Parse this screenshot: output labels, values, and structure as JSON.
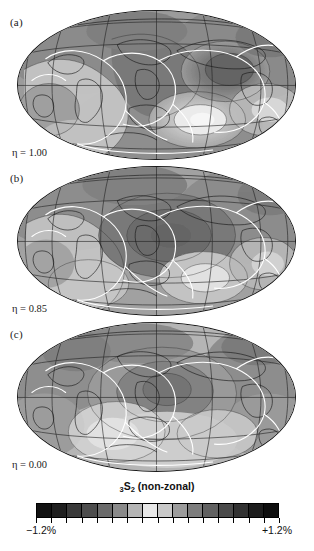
{
  "figure": {
    "type": "map-series",
    "projection": "hammer",
    "panels": [
      {
        "id": "a",
        "label": "(a)",
        "eta_symbol": "η",
        "eta_text": "η = 1.00",
        "eta_value": "1.00"
      },
      {
        "id": "b",
        "label": "(b)",
        "eta_symbol": "η",
        "eta_text": "η = 0.85",
        "eta_value": "0.85"
      },
      {
        "id": "c",
        "label": "(c)",
        "eta_symbol": "η",
        "eta_text": "η = 0.00",
        "eta_value": "0.00"
      }
    ]
  },
  "colorbar": {
    "title_prefix_sub": "3",
    "title_main": "S",
    "title_main_sub": "2",
    "title_suffix": " (non-zonal)",
    "title_full": "₃S₂ (non-zonal)",
    "min_label": "−1.2%",
    "max_label": "+1.2%",
    "min_value": -1.2,
    "max_value": 1.2,
    "units": "%",
    "segments": 16,
    "colors": [
      "#121212",
      "#1f1f1f",
      "#3a3a3a",
      "#4d4d4d",
      "#6b6b6b",
      "#8a8a8a",
      "#b5b5b5",
      "#e8e8e8",
      "#c9c9c9",
      "#9c9c9c",
      "#7d7d7d",
      "#616161",
      "#4a4a4a",
      "#323232",
      "#1d1d1d",
      "#0e0e0e"
    ],
    "tick_count": 17
  },
  "chart_data": {
    "type": "heatmap",
    "xlabel": "",
    "ylabel": "",
    "legend_position": "bottom",
    "grid": true,
    "colormap": "diverging-greyscale",
    "zlim": [
      -1.2,
      1.2
    ],
    "zunits": "%",
    "panels": [
      {
        "label": "(a)",
        "parameter": "η",
        "value": 1.0
      },
      {
        "label": "(b)",
        "parameter": "η",
        "value": 0.85
      },
      {
        "label": "(c)",
        "parameter": "η",
        "value": 0.0
      }
    ],
    "graticule": {
      "meridian_spacing_deg": 30,
      "parallel_spacing_deg": 30
    },
    "overlays": [
      "coastlines",
      "tectonic-plate-boundaries"
    ]
  }
}
